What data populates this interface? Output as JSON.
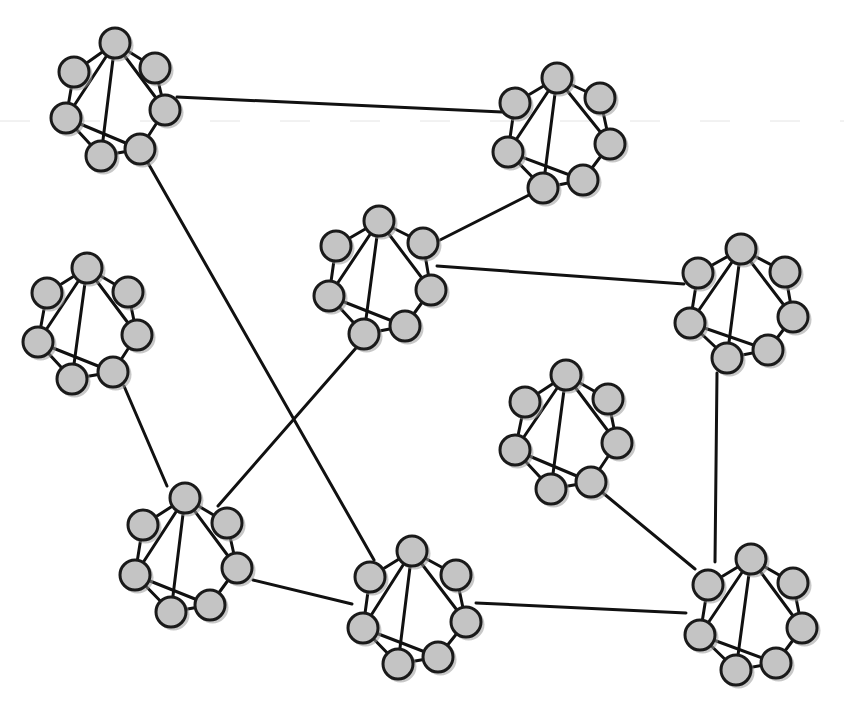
{
  "diagram": {
    "width": 844,
    "height": 714,
    "colors": {
      "background": "#ffffff",
      "node_fill": "#c4c4c4",
      "node_stroke": "#1a1a1a",
      "edge": "#111111"
    },
    "node_radius": 15,
    "cluster_internal_edges": [
      [
        "top",
        "ul"
      ],
      [
        "top",
        "ur"
      ],
      [
        "ur",
        "r"
      ],
      [
        "r",
        "br"
      ],
      [
        "br",
        "bl"
      ],
      [
        "bl",
        "l"
      ],
      [
        "l",
        "ul"
      ],
      [
        "top",
        "l"
      ],
      [
        "top",
        "bl"
      ],
      [
        "top",
        "r"
      ],
      [
        "l",
        "br"
      ]
    ],
    "clusters": [
      {
        "id": "c1",
        "nodes": {
          "top": [
            115,
            43
          ],
          "ul": [
            74,
            72
          ],
          "ur": [
            155,
            68
          ],
          "l": [
            66,
            118
          ],
          "r": [
            165,
            110
          ],
          "bl": [
            101,
            156
          ],
          "br": [
            140,
            149
          ]
        }
      },
      {
        "id": "c2",
        "nodes": {
          "top": [
            557,
            78
          ],
          "ul": [
            515,
            103
          ],
          "ur": [
            600,
            98
          ],
          "l": [
            508,
            152
          ],
          "r": [
            610,
            144
          ],
          "bl": [
            543,
            188
          ],
          "br": [
            583,
            180
          ]
        }
      },
      {
        "id": "c3",
        "nodes": {
          "top": [
            379,
            221
          ],
          "ul": [
            336,
            246
          ],
          "ur": [
            423,
            243
          ],
          "l": [
            329,
            296
          ],
          "r": [
            431,
            290
          ],
          "bl": [
            364,
            334
          ],
          "br": [
            405,
            326
          ]
        }
      },
      {
        "id": "c4",
        "nodes": {
          "top": [
            741,
            249
          ],
          "ul": [
            698,
            273
          ],
          "ur": [
            785,
            272
          ],
          "l": [
            690,
            323
          ],
          "r": [
            793,
            317
          ],
          "bl": [
            727,
            358
          ],
          "br": [
            768,
            350
          ]
        }
      },
      {
        "id": "c5",
        "nodes": {
          "top": [
            87,
            268
          ],
          "ul": [
            47,
            293
          ],
          "ur": [
            128,
            292
          ],
          "l": [
            38,
            342
          ],
          "r": [
            137,
            335
          ],
          "bl": [
            72,
            379
          ],
          "br": [
            113,
            372
          ]
        }
      },
      {
        "id": "c6",
        "nodes": {
          "top": [
            566,
            375
          ],
          "ul": [
            525,
            402
          ],
          "ur": [
            608,
            399
          ],
          "l": [
            515,
            450
          ],
          "r": [
            617,
            443
          ],
          "bl": [
            551,
            489
          ],
          "br": [
            591,
            482
          ]
        }
      },
      {
        "id": "c7",
        "nodes": {
          "top": [
            185,
            498
          ],
          "ul": [
            143,
            525
          ],
          "ur": [
            227,
            523
          ],
          "l": [
            135,
            575
          ],
          "r": [
            237,
            568
          ],
          "bl": [
            171,
            612
          ],
          "br": [
            210,
            605
          ]
        }
      },
      {
        "id": "c8",
        "nodes": {
          "top": [
            412,
            551
          ],
          "ul": [
            370,
            577
          ],
          "ur": [
            456,
            575
          ],
          "l": [
            363,
            628
          ],
          "r": [
            466,
            622
          ],
          "bl": [
            398,
            664
          ],
          "br": [
            438,
            657
          ]
        }
      },
      {
        "id": "c9",
        "nodes": {
          "top": [
            751,
            559
          ],
          "ul": [
            708,
            585
          ],
          "ur": [
            793,
            583
          ],
          "l": [
            700,
            635
          ],
          "r": [
            802,
            628
          ],
          "bl": [
            736,
            670
          ],
          "br": [
            776,
            663
          ]
        }
      }
    ],
    "inter_cluster_edges": [
      {
        "from": [
          177,
          97
        ],
        "to": [
          502,
          112
        ]
      },
      {
        "from": [
          148,
          163
        ],
        "to": [
          374,
          560
        ]
      },
      {
        "from": [
          440,
          240
        ],
        "to": [
          529,
          195
        ]
      },
      {
        "from": [
          437,
          266
        ],
        "to": [
          684,
          284
        ]
      },
      {
        "from": [
          356,
          348
        ],
        "to": [
          218,
          506
        ]
      },
      {
        "from": [
          124,
          386
        ],
        "to": [
          167,
          486
        ]
      },
      {
        "from": [
          717,
          373
        ],
        "to": [
          715,
          562
        ]
      },
      {
        "from": [
          603,
          493
        ],
        "to": [
          695,
          569
        ]
      },
      {
        "from": [
          253,
          580
        ],
        "to": [
          352,
          604
        ]
      },
      {
        "from": [
          476,
          603
        ],
        "to": [
          686,
          613
        ]
      }
    ],
    "artifacts": {
      "scan_line_y": 121
    }
  }
}
